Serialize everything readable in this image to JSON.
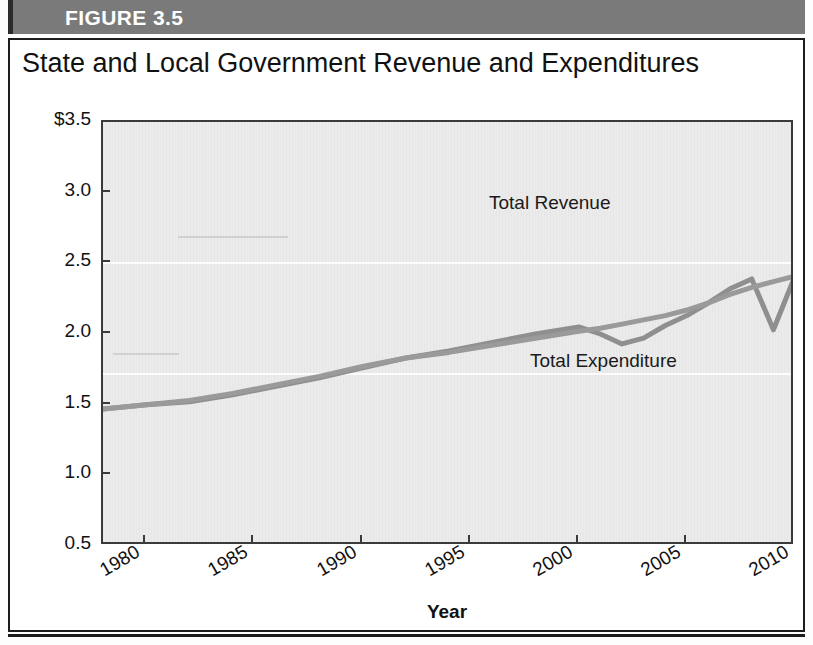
{
  "figure": {
    "header_label": "FIGURE 3.5",
    "header_bg": "#7a7a7a",
    "header_text_color": "#ffffff"
  },
  "chart_data": {
    "type": "line",
    "title": "State and Local Government Revenue and Expenditures",
    "xlabel": "Year",
    "ylabel": "Trillions of 2010 Dollars",
    "xlim": [
      1978,
      2010
    ],
    "ylim": [
      0.5,
      3.5
    ],
    "grid": true,
    "grid_color": "#ffffff",
    "plot_background": "#ebebeb",
    "legend_position": "inline-labels",
    "ytick_labels": [
      "$3.5",
      "3.0",
      "2.5",
      "2.0",
      "1.5",
      "1.0",
      "0.5"
    ],
    "ytick_values": [
      3.5,
      3.0,
      2.5,
      2.0,
      1.5,
      1.0,
      0.5
    ],
    "xtick_labels": [
      "1980",
      "1985",
      "1990",
      "1995",
      "2000",
      "2005",
      "2010"
    ],
    "xtick_values": [
      1980,
      1985,
      1990,
      1995,
      2000,
      2005,
      2010
    ],
    "x": [
      1978,
      1980,
      1982,
      1984,
      1986,
      1988,
      1990,
      1992,
      1994,
      1996,
      1998,
      2000,
      2001,
      2002,
      2003,
      2004,
      2005,
      2006,
      2007,
      2008,
      2009,
      2010
    ],
    "series": [
      {
        "name": "Total Revenue",
        "color": "#8f8f8f",
        "values": [
          1.47,
          1.5,
          1.52,
          1.57,
          1.63,
          1.69,
          1.76,
          1.83,
          1.88,
          1.94,
          2.0,
          2.05,
          2.0,
          1.93,
          1.97,
          2.06,
          2.13,
          2.22,
          2.32,
          2.39,
          2.03,
          2.41
        ]
      },
      {
        "name": "Total Expenditure",
        "color": "#9a9a9a",
        "values": [
          1.47,
          1.5,
          1.53,
          1.58,
          1.64,
          1.7,
          1.77,
          1.83,
          1.87,
          1.92,
          1.97,
          2.02,
          2.04,
          2.07,
          2.1,
          2.13,
          2.17,
          2.22,
          2.28,
          2.33,
          2.37,
          2.41
        ]
      }
    ],
    "annotations": [
      {
        "text": "Total Revenue",
        "x": 1995.5,
        "y": 2.08
      },
      {
        "text": "Total Expenditure",
        "x": 1997.5,
        "y": 1.66
      }
    ]
  }
}
